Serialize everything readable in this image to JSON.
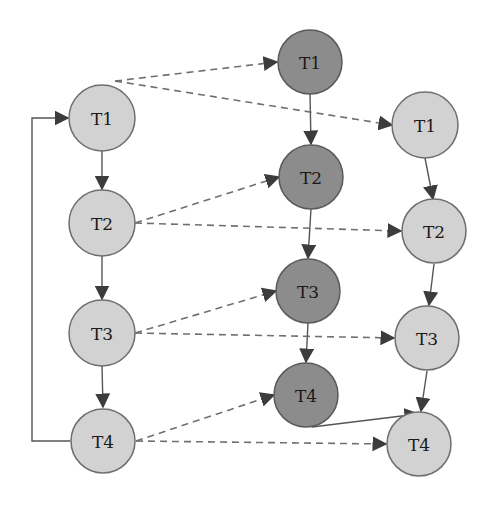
{
  "diagram": {
    "type": "task-graph",
    "colors": {
      "light_node": "#d2d2d2",
      "dark_node": "#8c8c8c",
      "edge": "#555555"
    },
    "columns": {
      "left": {
        "shade": "light",
        "nodes": [
          {
            "id": "L1",
            "label": "T1"
          },
          {
            "id": "L2",
            "label": "T2"
          },
          {
            "id": "L3",
            "label": "T3"
          },
          {
            "id": "L4",
            "label": "T4"
          }
        ]
      },
      "middle": {
        "shade": "dark",
        "nodes": [
          {
            "id": "M1",
            "label": "T1"
          },
          {
            "id": "M2",
            "label": "T2"
          },
          {
            "id": "M3",
            "label": "T3"
          },
          {
            "id": "M4",
            "label": "T4"
          }
        ]
      },
      "right": {
        "shade": "light",
        "nodes": [
          {
            "id": "R1",
            "label": "T1"
          },
          {
            "id": "R2",
            "label": "T2"
          },
          {
            "id": "R3",
            "label": "T3"
          },
          {
            "id": "R4",
            "label": "T4"
          }
        ]
      }
    },
    "edges": [
      {
        "from": "L1",
        "to": "L2",
        "style": "solid"
      },
      {
        "from": "L2",
        "to": "L3",
        "style": "solid"
      },
      {
        "from": "L3",
        "to": "L4",
        "style": "solid"
      },
      {
        "from": "L4",
        "to": "L1",
        "style": "solid",
        "note": "feedback loop"
      },
      {
        "from": "M1",
        "to": "M2",
        "style": "solid"
      },
      {
        "from": "M2",
        "to": "M3",
        "style": "solid"
      },
      {
        "from": "M3",
        "to": "M4",
        "style": "solid"
      },
      {
        "from": "M4",
        "to": "R4",
        "style": "solid"
      },
      {
        "from": "R1",
        "to": "R2",
        "style": "solid"
      },
      {
        "from": "R2",
        "to": "R3",
        "style": "solid"
      },
      {
        "from": "R3",
        "to": "R4",
        "style": "solid"
      },
      {
        "from": "L1",
        "to": "M1",
        "style": "dashed"
      },
      {
        "from": "L1",
        "to": "R1",
        "style": "dashed"
      },
      {
        "from": "L2",
        "to": "M2",
        "style": "dashed"
      },
      {
        "from": "L2",
        "to": "R2",
        "style": "dashed"
      },
      {
        "from": "L3",
        "to": "M3",
        "style": "dashed"
      },
      {
        "from": "L3",
        "to": "R3",
        "style": "dashed"
      },
      {
        "from": "L4",
        "to": "M4",
        "style": "dashed"
      },
      {
        "from": "L4",
        "to": "R4",
        "style": "dashed"
      }
    ]
  }
}
